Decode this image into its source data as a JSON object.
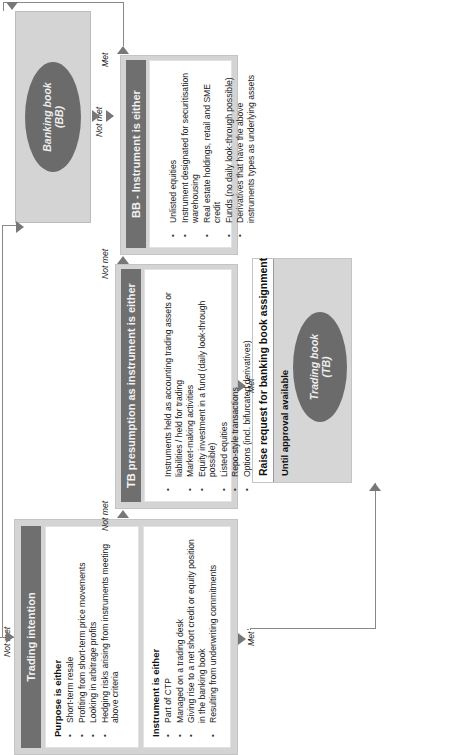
{
  "trading_intention": {
    "title": "Trading intention",
    "purpose_heading": "Purpose is either",
    "purpose_items": [
      "Short-term resale",
      "Profiting from short-term price movements",
      "Looking in arbitrage profits",
      "Hedging risks arising from instruments meeting above criteria"
    ],
    "instrument_heading": "Instrument is either",
    "instrument_items": [
      "Part of CTP",
      "Managed on a trading desk",
      "Giving rise to a net short credit or equity position in the banking book",
      "Resulting from underwriting commitments"
    ]
  },
  "tb_presumption": {
    "title": "TB presumption as instrument is either",
    "items": [
      "Instruments held as accounting trading assets or liabilities / held for trading",
      "Market-making activities",
      "Equity investment in a fund (daily look-through possible)",
      "Listed equities",
      "Repo-style transactions",
      "Options (incl. bifurcated derivatives)"
    ]
  },
  "bb_instrument": {
    "title": "BB - Instrument is either",
    "items": [
      "Unlisted equities",
      "Instrument designated for securitisation warehousing",
      "Real estate holdings, retail and SME credit",
      "Funds (no daily look-through possible)",
      "Derivatives that have the above instruments types as underlying assets"
    ]
  },
  "banking_book": {
    "line1": "Banking book",
    "line2": "(BB)"
  },
  "raise_request": {
    "title": "Raise request for banking book assignment",
    "subtitle": "Until approval available",
    "trading_book": {
      "line1": "Trading book",
      "line2": "(TB)"
    }
  },
  "connectors": {
    "not_met": "Not met",
    "met": "Met"
  },
  "colors": {
    "header_bg": "#6f6f6f",
    "panel_bg": "#d4d4d4",
    "ellipse_bg": "#6b6b6b",
    "line": "#888888"
  }
}
